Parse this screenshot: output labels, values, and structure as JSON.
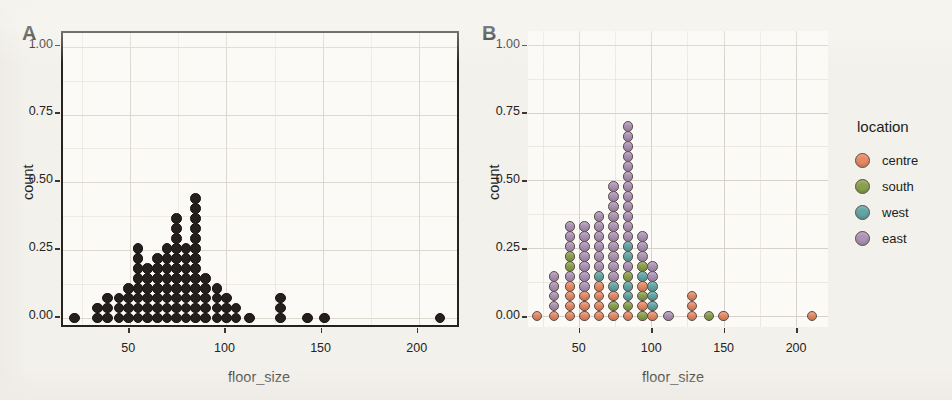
{
  "figure": {
    "background_color": "#f3f1ec",
    "panels": [
      {
        "tag": "A"
      },
      {
        "tag": "B"
      }
    ]
  },
  "legend": {
    "title": "location",
    "items": [
      {
        "label": "centre",
        "color": "#e78a64"
      },
      {
        "label": "south",
        "color": "#8aa14c"
      },
      {
        "label": "west",
        "color": "#62a6a6"
      },
      {
        "label": "east",
        "color": "#ad93b6"
      }
    ]
  },
  "axes": {
    "x_title": "floor_size",
    "y_title": "count",
    "x_ticks": [
      "50",
      "100",
      "150",
      "200"
    ],
    "x_tick_values": [
      50,
      100,
      150,
      200
    ],
    "y_ticks": [
      "0.00",
      "0.25",
      "0.50",
      "0.75",
      "1.00"
    ],
    "y_tick_values": [
      0.0,
      0.25,
      0.5,
      0.75,
      1.0
    ]
  },
  "chart_data": {
    "type": "scatter",
    "title": "",
    "subtitle": "",
    "xlabel": "floor_size",
    "ylabel": "count",
    "xlim": [
      15,
      222
    ],
    "ylim": [
      -0.04,
      1.05
    ],
    "grid": true,
    "legend_position": "right",
    "legend_title": "location",
    "plot_style": "dotplot (stacked dots, binned)",
    "dot_diameter_y": 0.0385,
    "bin_width_x": 5.2,
    "panels": [
      {
        "tag": "A",
        "colored_by": "none",
        "dot_color": "#241f1c",
        "panel_border": true,
        "bins": [
          {
            "x": 21,
            "count": 1
          },
          {
            "x": 33,
            "count": 2
          },
          {
            "x": 38,
            "count": 3
          },
          {
            "x": 44,
            "count": 3
          },
          {
            "x": 49,
            "count": 4
          },
          {
            "x": 54,
            "count": 8
          },
          {
            "x": 59,
            "count": 6
          },
          {
            "x": 64,
            "count": 7
          },
          {
            "x": 69,
            "count": 8
          },
          {
            "x": 74,
            "count": 11
          },
          {
            "x": 79,
            "count": 8
          },
          {
            "x": 84,
            "count": 13
          },
          {
            "x": 89,
            "count": 5
          },
          {
            "x": 95,
            "count": 4
          },
          {
            "x": 100,
            "count": 3
          },
          {
            "x": 105,
            "count": 2
          },
          {
            "x": 112,
            "count": 1
          },
          {
            "x": 128,
            "count": 3
          },
          {
            "x": 142,
            "count": 1
          },
          {
            "x": 151,
            "count": 1
          },
          {
            "x": 211,
            "count": 1
          }
        ]
      },
      {
        "tag": "B",
        "colored_by": "location",
        "panel_border": false,
        "bins": [
          {
            "x": 21,
            "stack": [
              "centre"
            ]
          },
          {
            "x": 33,
            "stack": [
              "centre",
              "east",
              "east",
              "east",
              "east"
            ]
          },
          {
            "x": 44,
            "stack": [
              "centre",
              "centre",
              "centre",
              "centre",
              "east",
              "south",
              "south",
              "east",
              "east",
              "east"
            ]
          },
          {
            "x": 54,
            "stack": [
              "centre",
              "centre",
              "centre",
              "east",
              "east",
              "east",
              "east",
              "east",
              "east",
              "east"
            ]
          },
          {
            "x": 64,
            "stack": [
              "centre",
              "centre",
              "centre",
              "centre",
              "west",
              "east",
              "east",
              "east",
              "east",
              "east",
              "east"
            ]
          },
          {
            "x": 74,
            "stack": [
              "centre",
              "south",
              "centre",
              "west",
              "east",
              "east",
              "east",
              "east",
              "east",
              "east",
              "east",
              "east",
              "east",
              "east"
            ]
          },
          {
            "x": 84,
            "stack": [
              "centre",
              "south",
              "west",
              "west",
              "south",
              "east",
              "west",
              "west",
              "east",
              "east",
              "east",
              "east",
              "east",
              "east",
              "east",
              "east",
              "east",
              "east",
              "east",
              "east"
            ]
          },
          {
            "x": 94,
            "stack": [
              "south",
              "centre",
              "south",
              "centre",
              "west",
              "south",
              "east",
              "east",
              "east"
            ]
          },
          {
            "x": 101,
            "stack": [
              "centre",
              "west",
              "west",
              "west",
              "east",
              "east"
            ]
          },
          {
            "x": 112,
            "stack": [
              "east"
            ]
          },
          {
            "x": 128,
            "stack": [
              "centre",
              "centre",
              "centre"
            ]
          },
          {
            "x": 140,
            "stack": [
              "south"
            ]
          },
          {
            "x": 150,
            "stack": [
              "centre"
            ]
          },
          {
            "x": 211,
            "stack": [
              "centre"
            ]
          }
        ]
      }
    ]
  }
}
